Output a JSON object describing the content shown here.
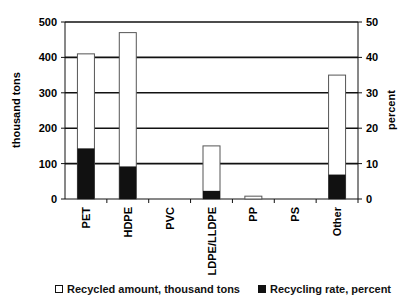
{
  "chart_data": {
    "type": "bar",
    "title": "",
    "categories": [
      "PET",
      "HDPE",
      "PVC",
      "LDPE/LLDPE",
      "PP",
      "PS",
      "Other"
    ],
    "series": [
      {
        "name": "Recycled amount, thousand tons",
        "axis": "left",
        "color": "#ffffff",
        "values": [
          410,
          470,
          0,
          150,
          8,
          0,
          350
        ]
      },
      {
        "name": "Recycling rate, percent",
        "axis": "right",
        "color": "#111111",
        "values": [
          14.3,
          9.2,
          0,
          2.3,
          0,
          0,
          6.9
        ]
      }
    ],
    "xlabel": "",
    "ylabel": "thousand tons",
    "ylabel_right": "percent",
    "ylim": [
      0,
      500
    ],
    "ylim_right": [
      0,
      50
    ],
    "yticks": [
      0,
      100,
      200,
      300,
      400,
      500
    ],
    "yticks_right": [
      0,
      10,
      20,
      30,
      40,
      50
    ],
    "grid": true,
    "legend_position": "bottom"
  },
  "legend": {
    "items": [
      {
        "label": "Recycled amount, thousand tons",
        "color": "#ffffff"
      },
      {
        "label": "Recycling rate, percent",
        "color": "#111111"
      }
    ]
  }
}
